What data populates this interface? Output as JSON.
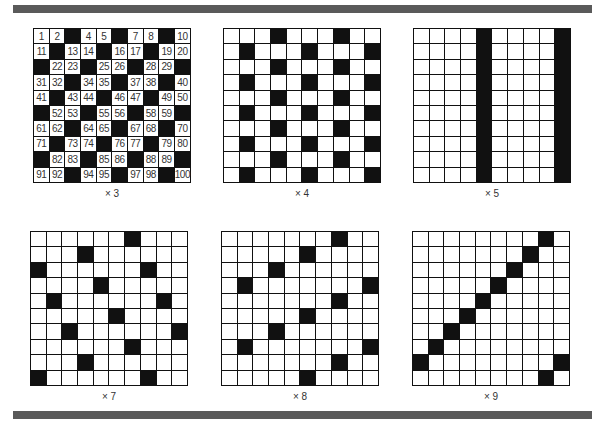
{
  "panels": [
    {
      "multiplier": 3,
      "label": "× 3",
      "show_numbers": true
    },
    {
      "multiplier": 4,
      "label": "× 4",
      "show_numbers": false
    },
    {
      "multiplier": 5,
      "label": "× 5",
      "show_numbers": false
    },
    {
      "multiplier": 7,
      "label": "× 7",
      "show_numbers": false
    },
    {
      "multiplier": 8,
      "label": "× 8",
      "show_numbers": false
    },
    {
      "multiplier": 9,
      "label": "× 9",
      "show_numbers": false
    }
  ],
  "grid": {
    "rows": 10,
    "cols": 10,
    "start": 1,
    "end": 100
  },
  "colors": {
    "filled": "#111111",
    "empty": "#ffffff",
    "bar": "#5a5a5a"
  }
}
